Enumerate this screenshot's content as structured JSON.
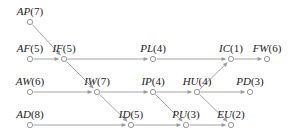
{
  "diagram": {
    "type": "activity-on-node-network",
    "background": "#ffffff",
    "edge_color": "#9a9a9a",
    "node_fill": "#ffffff",
    "node_stroke": "#8a8a8a",
    "text_color": "#1a1a1a",
    "nodes": [
      {
        "id": "AP",
        "code": "AP",
        "duration": 7,
        "label": "AP(7)",
        "x": 30,
        "y": 22
      },
      {
        "id": "AF",
        "code": "AF",
        "duration": 5,
        "label": "AF(5)",
        "x": 30,
        "y": 59
      },
      {
        "id": "IF",
        "code": "IF",
        "duration": 5,
        "label": "IF(5)",
        "x": 64,
        "y": 59
      },
      {
        "id": "PL",
        "code": "PL",
        "duration": 4,
        "label": "PL(4)",
        "x": 153,
        "y": 59
      },
      {
        "id": "IC",
        "code": "IC",
        "duration": 1,
        "label": "IC(1)",
        "x": 231,
        "y": 59
      },
      {
        "id": "FW",
        "code": "FW",
        "duration": 6,
        "label": "FW(6)",
        "x": 267,
        "y": 59
      },
      {
        "id": "AW",
        "code": "AW",
        "duration": 6,
        "label": "AW(6)",
        "x": 30,
        "y": 92
      },
      {
        "id": "IW",
        "code": "IW",
        "duration": 7,
        "label": "IW(7)",
        "x": 97,
        "y": 92
      },
      {
        "id": "IP",
        "code": "IP",
        "duration": 4,
        "label": "IP(4)",
        "x": 153,
        "y": 92
      },
      {
        "id": "HU",
        "code": "HU",
        "duration": 4,
        "label": "HU(4)",
        "x": 197,
        "y": 92
      },
      {
        "id": "PD",
        "code": "PD",
        "duration": 3,
        "label": "PD(3)",
        "x": 250,
        "y": 92
      },
      {
        "id": "AD",
        "code": "AD",
        "duration": 8,
        "label": "AD(8)",
        "x": 30,
        "y": 125
      },
      {
        "id": "ID",
        "code": "ID",
        "duration": 5,
        "label": "ID(5)",
        "x": 131,
        "y": 125
      },
      {
        "id": "PU",
        "code": "PU",
        "duration": 3,
        "label": "PU(3)",
        "x": 186,
        "y": 125
      },
      {
        "id": "EU",
        "code": "EU",
        "duration": 2,
        "label": "EU(2)",
        "x": 231,
        "y": 125
      }
    ],
    "edges": [
      {
        "from": "AP",
        "to": "IF"
      },
      {
        "from": "AF",
        "to": "IF"
      },
      {
        "from": "IF",
        "to": "PL"
      },
      {
        "from": "PL",
        "to": "IC"
      },
      {
        "from": "IC",
        "to": "FW"
      },
      {
        "from": "IF",
        "to": "IW"
      },
      {
        "from": "IW",
        "to": "ID"
      },
      {
        "from": "AW",
        "to": "IW"
      },
      {
        "from": "IW",
        "to": "IP"
      },
      {
        "from": "IP",
        "to": "HU"
      },
      {
        "from": "HU",
        "to": "PD"
      },
      {
        "from": "HU",
        "to": "IC"
      },
      {
        "from": "AD",
        "to": "ID"
      },
      {
        "from": "ID",
        "to": "PU"
      },
      {
        "from": "PU",
        "to": "EU"
      },
      {
        "from": "IP",
        "to": "PU"
      },
      {
        "from": "HU",
        "to": "EU"
      }
    ]
  }
}
